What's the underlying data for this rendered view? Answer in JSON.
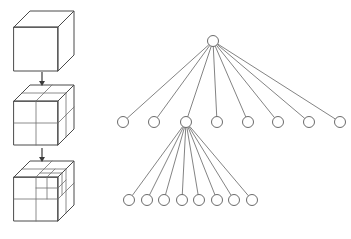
{
  "figure": {
    "background_color": "#ffffff",
    "line_color": "#4a4a4a",
    "node_fill": "#ffffff",
    "node_stroke": "#5a5a5a",
    "width": 351,
    "height": 239
  },
  "cube_panel": {
    "label": "octree-subdivision-sequence",
    "cubes": [
      {
        "name": "cube-level-0",
        "caption": "",
        "subdivision": "1x1x1",
        "origin_x": 14,
        "origin_y": 27,
        "face_size": 44,
        "depth_dx": 16,
        "depth_dy": -16
      },
      {
        "name": "cube-level-1",
        "caption": "",
        "subdivision": "2x2x2",
        "origin_x": 14,
        "origin_y": 101,
        "face_size": 44,
        "depth_dx": 16,
        "depth_dy": -16
      },
      {
        "name": "cube-level-2",
        "caption": "",
        "subdivision": "2x2x2 with one octant subdivided again",
        "origin_x": 14,
        "origin_y": 177,
        "face_size": 44,
        "depth_dx": 16,
        "depth_dy": -16
      }
    ],
    "arrows": [
      {
        "name": "arrow-level-0-to-1",
        "x": 42,
        "y_start": 72,
        "y_end": 86
      },
      {
        "name": "arrow-level-1-to-2",
        "x": 42,
        "y_start": 148,
        "y_end": 162
      }
    ]
  },
  "tree_panel": {
    "label": "octree-tree-diagram",
    "node_radius": 5.5,
    "root": {
      "name": "root-node",
      "label": "",
      "x": 213,
      "y": 41
    },
    "level1": {
      "name": "level-1-nodes",
      "count": 8,
      "y": 122,
      "nodes": [
        {
          "name": "level1-node-1",
          "label": "",
          "x": 123,
          "has_children": false
        },
        {
          "name": "level1-node-2",
          "label": "",
          "x": 154,
          "has_children": false
        },
        {
          "name": "level1-node-3",
          "label": "",
          "x": 186,
          "has_children": true
        },
        {
          "name": "level1-node-4",
          "label": "",
          "x": 217,
          "has_children": false
        },
        {
          "name": "level1-node-5",
          "label": "",
          "x": 248,
          "has_children": false
        },
        {
          "name": "level1-node-6",
          "label": "",
          "x": 278,
          "has_children": false
        },
        {
          "name": "level1-node-7",
          "label": "",
          "x": 309,
          "has_children": false
        },
        {
          "name": "level1-node-8",
          "label": "",
          "x": 340,
          "has_children": false
        }
      ]
    },
    "level2": {
      "name": "level-2-nodes",
      "count": 8,
      "y": 200,
      "parent_x": 186,
      "parent_y": 122,
      "nodes": [
        {
          "name": "level2-node-1",
          "label": "",
          "x": 129
        },
        {
          "name": "level2-node-2",
          "label": "",
          "x": 147
        },
        {
          "name": "level2-node-3",
          "label": "",
          "x": 164
        },
        {
          "name": "level2-node-4",
          "label": "",
          "x": 182
        },
        {
          "name": "level2-node-5",
          "label": "",
          "x": 199
        },
        {
          "name": "level2-node-6",
          "label": "",
          "x": 217
        },
        {
          "name": "level2-node-7",
          "label": "",
          "x": 234
        },
        {
          "name": "level2-node-8",
          "label": "",
          "x": 252
        }
      ]
    }
  }
}
